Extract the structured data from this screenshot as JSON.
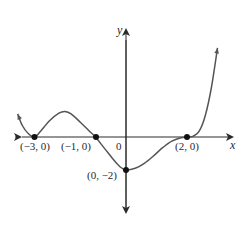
{
  "chart_data": {
    "type": "line",
    "title": "",
    "xlabel": "x",
    "ylabel": "y",
    "origin_label": "0",
    "xlim": [
      -3.9,
      3.2
    ],
    "ylim": [
      -3.2,
      5.5
    ],
    "grid": false,
    "curve": {
      "x": [
        -3.55,
        -3.4,
        -3.2,
        -3.0,
        -2.8,
        -2.5,
        -2.2,
        -2.0,
        -1.8,
        -1.5,
        -1.2,
        -1.0,
        -0.7,
        -0.4,
        -0.2,
        0.0,
        0.3,
        0.6,
        0.9,
        1.2,
        1.5,
        1.8,
        2.0,
        2.2,
        2.4,
        2.6,
        2.8,
        3.0
      ],
      "y": [
        1.4,
        0.7,
        0.2,
        0.0,
        0.35,
        1.0,
        1.45,
        1.55,
        1.4,
        0.9,
        0.35,
        0.0,
        -0.7,
        -1.4,
        -1.8,
        -2.0,
        -1.9,
        -1.6,
        -1.15,
        -0.65,
        -0.25,
        -0.05,
        0.0,
        0.05,
        0.35,
        1.3,
        3.0,
        5.4
      ]
    },
    "points": [
      {
        "x": -3,
        "y": 0,
        "label": "(−3, 0)"
      },
      {
        "x": -1,
        "y": 0,
        "label": "(−1, 0)"
      },
      {
        "x": 0,
        "y": -2,
        "label": "(0, −2)"
      },
      {
        "x": 2,
        "y": 0,
        "label": "(2, 0)"
      }
    ]
  }
}
